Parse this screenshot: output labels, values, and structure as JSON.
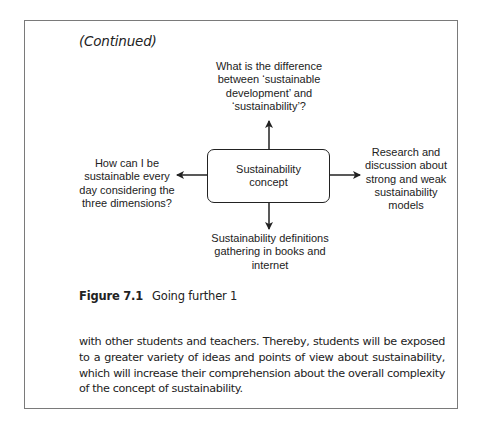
{
  "header": {
    "continued": "(Continued)"
  },
  "diagram": {
    "center": {
      "line1": "Sustainability",
      "line2": "concept"
    },
    "top": {
      "lines": [
        "What is the difference",
        "between ‘sustainable",
        "development’ and",
        "‘sustainability’?"
      ]
    },
    "left": {
      "lines": [
        "How can I be",
        "sustainable every",
        "day considering the",
        "three dimensions?"
      ]
    },
    "right": {
      "lines": [
        "Research and",
        "discussion about",
        "strong and weak",
        "sustainability",
        "models"
      ]
    },
    "bottom": {
      "lines": [
        "Sustainability definitions",
        "gathering in books and",
        "internet"
      ]
    },
    "colors": {
      "stroke": "#222222",
      "frame": "#7a7a7a"
    }
  },
  "caption": {
    "label": "Figure 7.1",
    "title": "Going further 1"
  },
  "body": {
    "paragraph": "with other students and teachers. Thereby, students will be exposed to a greater variety of ideas and points of view about sustainability, which will increase their comprehension about the overall complexity of the concept of sustainability."
  }
}
